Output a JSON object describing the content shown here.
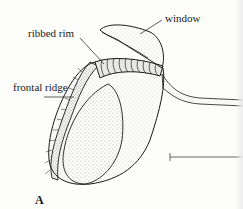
{
  "figure": {
    "panel": "A",
    "labels": {
      "window": "window",
      "ribbed_rim": "ribbed rim",
      "frontal_ridge": "frontal ridge"
    },
    "scale_bar": true
  },
  "colors": {
    "ink": "#1a1a1a",
    "paper": "#fdfdfb"
  }
}
